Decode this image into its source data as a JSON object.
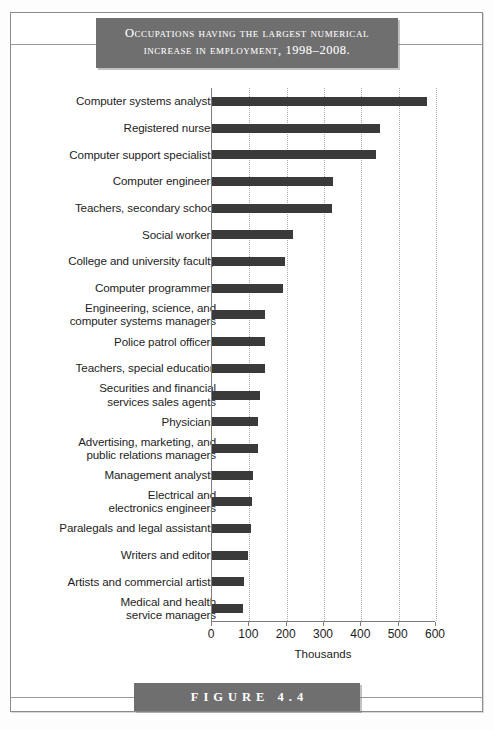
{
  "figure": {
    "title_line_1": "Occupations having the largest numerical",
    "title_line_2": "increase in employment, 1998–2008.",
    "caption": "FIGURE 4.4",
    "plaque_color": "#6f6f70",
    "bar_color": "#3a3a3a",
    "frame_color": "#8c8c8c",
    "grid_color": "#a9a9a9"
  },
  "chart_data": {
    "type": "bar",
    "orientation": "horizontal",
    "title": "Occupations having the largest numerical increase in employment, 1998–2008.",
    "xlabel": "Thousands",
    "ylabel": "",
    "xlim": [
      0,
      600
    ],
    "xticks": [
      0,
      100,
      200,
      300,
      400,
      500,
      600
    ],
    "xtick_labels": [
      "0",
      "100",
      "200",
      "300",
      "400",
      "500",
      "600"
    ],
    "grid": true,
    "grid_axis": "x",
    "legend": false,
    "categories": [
      "Computer systems analysts",
      "Registered nurses",
      "Computer support specialists",
      "Computer engineers",
      "Teachers, secondary school",
      "Social workers",
      "College and university faculty",
      "Computer programmers",
      "Engineering, science, and computer systems managers",
      "Police patrol officers",
      "Teachers, special education",
      "Securities and financial services sales agents",
      "Physicians",
      "Advertising, marketing, and public relations managers",
      "Management analysts",
      "Electrical and electronics engineers",
      "Paralegals and legal assistants",
      "Writers and editors",
      "Artists and commercial artists",
      "Medical and health service managers"
    ],
    "category_lines": [
      [
        "Computer systems analysts"
      ],
      [
        "Registered nurses"
      ],
      [
        "Computer support specialists"
      ],
      [
        "Computer engineers"
      ],
      [
        "Teachers, secondary school"
      ],
      [
        "Social workers"
      ],
      [
        "College and university faculty"
      ],
      [
        "Computer programmers"
      ],
      [
        "Engineering, science, and",
        "computer systems managers"
      ],
      [
        "Police patrol officers"
      ],
      [
        "Teachers, special education"
      ],
      [
        "Securities and financial",
        "services sales agents"
      ],
      [
        "Physicians"
      ],
      [
        "Advertising, marketing, and",
        "public relations managers"
      ],
      [
        "Management analysts"
      ],
      [
        "Electrical and",
        "electronics engineers"
      ],
      [
        "Paralegals and legal assistants"
      ],
      [
        "Writers and editors"
      ],
      [
        "Artists and commercial artists"
      ],
      [
        "Medical and health",
        "service managers"
      ]
    ],
    "values": [
      577,
      451,
      439,
      323,
      322,
      218,
      196,
      191,
      142,
      142,
      142,
      129,
      124,
      124,
      110,
      108,
      105,
      96,
      86,
      83
    ],
    "units": "thousands"
  }
}
